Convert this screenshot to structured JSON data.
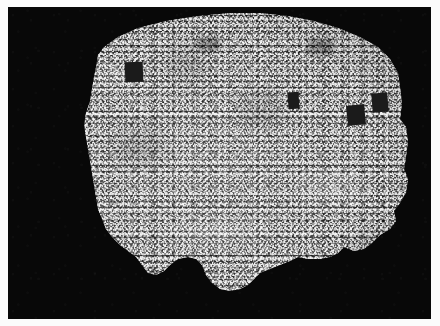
{
  "figure": {
    "domain_label": "astronomical-survey-density-map",
    "title": "",
    "caption": "",
    "canvas": {
      "width": 440,
      "height": 326
    },
    "paper_margin_color": "#fbfbfb"
  },
  "sky_panel": {
    "name": "sky-background-panel",
    "x": 8,
    "y": 7,
    "width": 423,
    "height": 312,
    "background_color": "#080808",
    "description": "Black sky background outside the survey footprint"
  },
  "colormap": {
    "name": "grayscale",
    "low_density_color": "#1b1b1b",
    "mid_density_color": "#8c8c8c",
    "high_density_color": "#f2f2f2",
    "outside_footprint_color": "#080808"
  },
  "survey_footprint": {
    "name": "survey-footprint-polygon",
    "description": "Irregular galaxy-survey footprint: smooth curved upper boundary with stepped tile edges on the left, right and bottom margins",
    "fill_color": "#8c8c8c",
    "edge_style": "stepped-tile-boundary",
    "polygon_points": "88,60 90,48 96,40 110,30 130,21 158,14 190,9 222,6 252,6 280,9 306,14 330,21 352,30 370,40 382,52 390,66 392,80 394,96 392,112 398,120 400,134 398,150 396,162 400,172 398,186 392,196 386,204 388,214 382,222 372,228 364,236 356,242 346,244 336,240 330,246 322,250 312,252 300,252 290,250 282,254 272,258 262,262 252,266 246,272 240,278 232,282 222,284 212,282 204,276 198,268 194,258 188,252 180,250 170,252 162,258 156,264 148,268 140,266 134,258 128,250 120,244 112,238 104,230 98,222 94,212 90,202 88,190 86,178 84,166 82,154 80,142 78,130 76,118 78,106 82,94 84,82 86,70"
  },
  "star_masks": {
    "name": "bright-star-mask-rectangles",
    "description": "Dark rectangular regions masked out around bright foreground stars",
    "count": 4,
    "fill_color": "#1b1b1b",
    "rects": [
      {
        "label": "mask-1",
        "x": 117,
        "y": 55,
        "width": 18,
        "height": 20,
        "rotation": -2
      },
      {
        "label": "mask-2",
        "x": 280,
        "y": 85,
        "width": 11,
        "height": 17,
        "rotation": -4
      },
      {
        "label": "mask-3",
        "x": 339,
        "y": 98,
        "width": 18,
        "height": 20,
        "rotation": -6
      },
      {
        "label": "mask-4",
        "x": 364,
        "y": 86,
        "width": 16,
        "height": 19,
        "rotation": -5
      }
    ]
  },
  "faint_patches": {
    "name": "low-density-patches",
    "description": "Diffuse lower-density (darker) regions within the footprint",
    "rects": [
      {
        "label": "patch-top-center",
        "x": 190,
        "y": 30,
        "width": 22,
        "height": 14
      },
      {
        "label": "patch-upper-right",
        "x": 300,
        "y": 32,
        "width": 26,
        "height": 16
      }
    ]
  },
  "structure": {
    "type": "projected-galaxy-density",
    "visible_features": [
      "filamentary cosmic-web structure",
      "under-dense voids",
      "high-density clusters and knots",
      "pixel-scale shot noise from galaxy counts"
    ]
  },
  "chart_data": {
    "type": "heatmap",
    "title": "",
    "xlabel": "",
    "ylabel": "",
    "colorbar": {
      "visible": false,
      "label": ""
    },
    "axes_visible": false,
    "tick_labels": {
      "x": [],
      "y": []
    },
    "legend": {
      "visible": false,
      "entries": []
    },
    "grid": false,
    "projection": "equal-area sky projection of survey footprint",
    "value_range": [
      0,
      1
    ]
  }
}
